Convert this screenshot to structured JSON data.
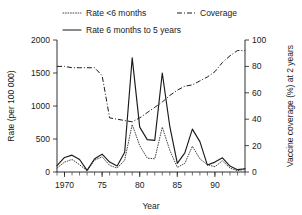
{
  "chart_data": {
    "type": "line",
    "title": "",
    "xlabel": "Year",
    "ylabel": "Rate (per 100 000)",
    "y2label": "Vaccine coverage (%) at 2 years",
    "xlim": [
      1969,
      1994
    ],
    "ylim": [
      0,
      2000
    ],
    "y2lim": [
      0,
      100
    ],
    "grid": false,
    "legend_position": "top",
    "x_ticks": [
      1970,
      1975,
      1980,
      1985,
      1990
    ],
    "x_tick_labels": [
      "1970",
      "75",
      "80",
      "85",
      "90"
    ],
    "x_minor_tick_step": 1,
    "y_ticks": [
      0,
      500,
      1000,
      1500,
      2000
    ],
    "y_tick_labels": [
      "0",
      "500",
      "1000",
      "1500",
      "2000"
    ],
    "y2_ticks": [
      0,
      20,
      40,
      60,
      80,
      100
    ],
    "y2_tick_labels": [
      "0",
      "20",
      "40",
      "60",
      "80",
      "100"
    ],
    "x": [
      1969,
      1970,
      1971,
      1972,
      1973,
      1974,
      1975,
      1976,
      1977,
      1978,
      1979,
      1980,
      1981,
      1982,
      1983,
      1984,
      1985,
      1986,
      1987,
      1988,
      1989,
      1990,
      1991,
      1992,
      1993,
      1994
    ],
    "series": [
      {
        "name": "Rate <6 months",
        "axis": "left",
        "style": "dotted",
        "color": "#3a3a3a",
        "values": [
          60,
          150,
          190,
          110,
          20,
          180,
          230,
          100,
          60,
          180,
          720,
          400,
          210,
          200,
          680,
          330,
          70,
          130,
          390,
          200,
          110,
          80,
          170,
          60,
          20,
          40
        ]
      },
      {
        "name": "Rate 6 months to 5 years",
        "axis": "left",
        "style": "solid",
        "color": "#1a1a1a",
        "values": [
          95,
          220,
          255,
          190,
          25,
          200,
          270,
          150,
          90,
          300,
          1730,
          680,
          490,
          480,
          1500,
          690,
          130,
          290,
          650,
          460,
          105,
          150,
          215,
          90,
          35,
          50
        ]
      },
      {
        "name": "Coverage",
        "axis": "right",
        "style": "dashdot",
        "color": "#1a1a1a",
        "values": [
          80,
          80,
          79,
          79,
          79,
          79,
          73,
          41,
          40,
          39,
          38,
          41,
          45,
          49,
          53,
          58,
          62,
          65,
          66,
          69,
          72,
          76,
          83,
          88,
          92,
          92
        ]
      }
    ],
    "legend": [
      {
        "label": "Rate <6 months",
        "style": "dotted"
      },
      {
        "label": "Coverage",
        "style": "dashdot"
      },
      {
        "label": "Rate 6 months to 5 years",
        "style": "solid"
      }
    ]
  }
}
